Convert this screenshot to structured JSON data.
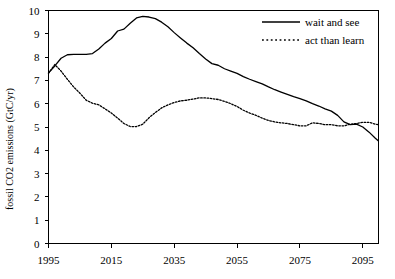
{
  "chart_data": {
    "type": "line",
    "title": "",
    "subtitle": "",
    "xlabel": "",
    "ylabel": "fossil CO2 emissions (GtC/yr)",
    "xlim": [
      1995,
      2100
    ],
    "ylim": [
      0,
      10
    ],
    "xticks": [
      1995,
      2015,
      2035,
      2055,
      2075,
      2095
    ],
    "xtick_labels": [
      "1995",
      "2015",
      "2035",
      "2055",
      "2075",
      "2095"
    ],
    "yticks": [
      0,
      1,
      2,
      3,
      4,
      5,
      6,
      7,
      8,
      9,
      10
    ],
    "ytick_labels": [
      "0",
      "1",
      "2",
      "3",
      "4",
      "5",
      "6",
      "7",
      "8",
      "9",
      "10"
    ],
    "grid": false,
    "legend_position": "top-right",
    "x": [
      1995,
      1997,
      1999,
      2001,
      2003,
      2005,
      2007,
      2009,
      2011,
      2013,
      2015,
      2017,
      2019,
      2021,
      2023,
      2025,
      2027,
      2029,
      2031,
      2033,
      2035,
      2037,
      2039,
      2041,
      2043,
      2045,
      2047,
      2049,
      2051,
      2053,
      2055,
      2057,
      2059,
      2061,
      2063,
      2065,
      2067,
      2069,
      2071,
      2073,
      2075,
      2077,
      2079,
      2081,
      2083,
      2085,
      2087,
      2089,
      2091,
      2093,
      2095,
      2097,
      2099,
      2100
    ],
    "series": [
      {
        "name": "wait and see",
        "style": "solid",
        "color": "#000000",
        "values": [
          7.32,
          7.62,
          7.95,
          8.1,
          8.12,
          8.12,
          8.12,
          8.15,
          8.35,
          8.6,
          8.8,
          9.12,
          9.2,
          9.45,
          9.68,
          9.75,
          9.72,
          9.65,
          9.5,
          9.3,
          9.05,
          8.82,
          8.6,
          8.4,
          8.15,
          7.92,
          7.72,
          7.65,
          7.5,
          7.4,
          7.3,
          7.16,
          7.05,
          6.95,
          6.85,
          6.72,
          6.6,
          6.5,
          6.4,
          6.3,
          6.22,
          6.12,
          6.0,
          5.9,
          5.78,
          5.68,
          5.5,
          5.22,
          5.1,
          5.12,
          5.0,
          4.78,
          4.52,
          4.4
        ]
      },
      {
        "name": "act than learn",
        "style": "dotted",
        "color": "#000000",
        "values": [
          7.3,
          7.68,
          7.4,
          7.05,
          6.72,
          6.45,
          6.15,
          6.02,
          5.95,
          5.78,
          5.6,
          5.38,
          5.15,
          5.02,
          5.02,
          5.12,
          5.4,
          5.62,
          5.82,
          5.95,
          6.05,
          6.12,
          6.15,
          6.2,
          6.25,
          6.25,
          6.22,
          6.18,
          6.1,
          6.0,
          5.88,
          5.72,
          5.6,
          5.5,
          5.38,
          5.28,
          5.22,
          5.18,
          5.15,
          5.1,
          5.05,
          5.05,
          5.18,
          5.15,
          5.1,
          5.1,
          5.05,
          5.05,
          5.12,
          5.15,
          5.2,
          5.2,
          5.12,
          5.1
        ]
      }
    ]
  },
  "legend": {
    "items": [
      {
        "label": "wait and see",
        "style": "solid"
      },
      {
        "label": "act than learn",
        "style": "dotted"
      }
    ]
  }
}
